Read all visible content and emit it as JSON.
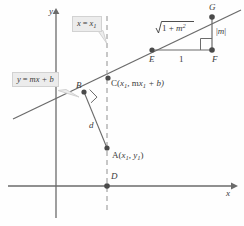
{
  "figure": {
    "background_color": "#fefefe",
    "line_color": "#6b6b6b",
    "axis_color": "#6b6b6b",
    "text_color": "#3a3a3a",
    "callout_fill": "#ececec",
    "callout_border": "#d2d2d2"
  },
  "axes": {
    "x_label": "x",
    "y_label": "y"
  },
  "callouts": {
    "line_equation": {
      "lhs": "y",
      "eq": "=",
      "rhs": "mx + b",
      "full": "y = mx + b"
    },
    "vertical_line": {
      "lhs": "x",
      "eq": "=",
      "rhs": "x",
      "sub": "1",
      "full": "x = x1"
    }
  },
  "points": [
    {
      "id": "B",
      "label": "B",
      "x": 84,
      "y": 92
    },
    {
      "id": "C",
      "label": "C",
      "x": 108,
      "y": 78,
      "annotation": "C(x1, mx1 + b)"
    },
    {
      "id": "A",
      "label": "A",
      "x": 107,
      "y": 148,
      "annotation": "A(x1, y1)"
    },
    {
      "id": "D",
      "label": "D",
      "x": 107,
      "y": 186
    },
    {
      "id": "E",
      "label": "E",
      "x": 152,
      "y": 50
    },
    {
      "id": "F",
      "label": "F",
      "x": 212,
      "y": 50
    },
    {
      "id": "G",
      "label": "G",
      "x": 212,
      "y": 17
    }
  ],
  "segment_labels": {
    "distance": "d",
    "hypotenuse": "1 + m",
    "hypotenuse_full": "sqrt(1 + m^2)",
    "run": "1",
    "rise": "|m|"
  },
  "point_annotations": {
    "C_open": "C(",
    "C_mid": ", m",
    "C_end": " + b)",
    "A_open": "A(",
    "A_mid": ", ",
    "A_end": ")"
  },
  "subscripts": {
    "one": "1"
  },
  "variables": {
    "x": "x",
    "y": "y",
    "m": "m",
    "b": "b",
    "two": "2"
  }
}
